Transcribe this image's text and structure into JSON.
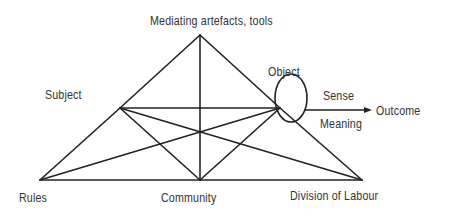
{
  "diagram": {
    "nodes": {
      "mediating": {
        "label": "Mediating artefacts, tools"
      },
      "subject": {
        "label": "Subject"
      },
      "object": {
        "label": "Object"
      },
      "sense": {
        "label": "Sense"
      },
      "meaning": {
        "label": "Meaning"
      },
      "outcome": {
        "label": "Outcome"
      },
      "rules": {
        "label": "Rules"
      },
      "community": {
        "label": "Community"
      },
      "division": {
        "label": "Division of Labour"
      }
    },
    "colors": {
      "line": "#222222",
      "text": "#333333",
      "background": "#ffffff"
    }
  }
}
